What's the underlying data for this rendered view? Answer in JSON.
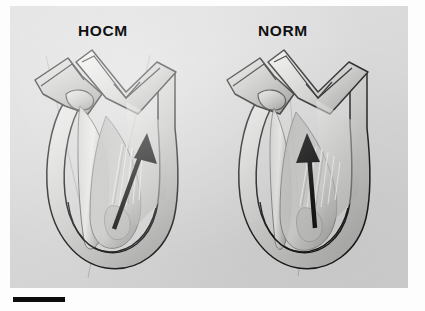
{
  "figure": {
    "type": "medical-illustration",
    "modality": "grayscale anatomic cross-section comparison",
    "background_color": "#d9d9d9",
    "plate_color": "#fdfdfd",
    "ink_color": "#101010"
  },
  "panels": [
    {
      "id": "hocm",
      "label": "HOCM",
      "label_position": {
        "x": 78,
        "y": 22
      },
      "description": "Heart with hypertrophied interventricular septum narrowing the left ventricular outflow tract",
      "arrow": {
        "name": "blood-flow-arrow",
        "color": "#0a0a0a",
        "tail": {
          "x": 104,
          "y": 223
        },
        "head": {
          "x": 137,
          "y": 131
        },
        "orientation": "angled-rightward",
        "meaning": "direction of left ventricular outflow"
      },
      "reference_axes": [
        {
          "name": "outflow-axis-line",
          "from": {
            "x": 46,
            "y": 56
          },
          "to": {
            "x": 92,
            "y": 253
          }
        },
        {
          "name": "septal-axis-line",
          "from": {
            "x": 150,
            "y": 55
          },
          "to": {
            "x": 120,
            "y": 173
          }
        }
      ]
    },
    {
      "id": "norm",
      "label": "NORM",
      "label_position": {
        "x": 258,
        "y": 22
      },
      "description": "Normal heart with wide unobstructed left ventricular outflow tract",
      "arrow": {
        "name": "blood-flow-arrow",
        "color": "#0a0a0a",
        "tail": {
          "x": 305,
          "y": 222
        },
        "head": {
          "x": 297,
          "y": 130
        },
        "orientation": "near-vertical",
        "meaning": "direction of left ventricular outflow"
      },
      "reference_axes": [
        {
          "name": "outflow-axis-line",
          "from": {
            "x": 287,
            "y": 55
          },
          "to": {
            "x": 300,
            "y": 268
          }
        }
      ]
    }
  ],
  "scale_bar": {
    "name": "scale-bar",
    "x": 13,
    "y": 297,
    "width": 52,
    "height": 5,
    "color": "#0d0d0d",
    "caption": ""
  },
  "anatomy_keys": [
    "aorta",
    "aortic-valve",
    "left-atrium",
    "mitral-valve-leaflet",
    "interventricular-septum",
    "left-ventricular-cavity",
    "chordae-tendineae",
    "papillary-muscle",
    "ventricular-apex",
    "myocardial-wall"
  ]
}
